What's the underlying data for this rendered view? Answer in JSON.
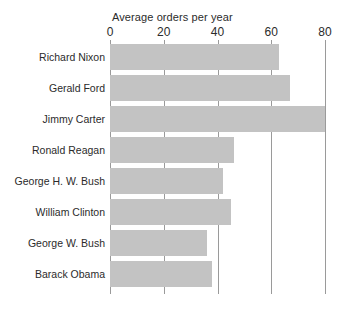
{
  "chart_data": {
    "type": "bar",
    "orientation": "horizontal",
    "title": "Average orders per year",
    "xlabel": "",
    "ylabel": "",
    "categories": [
      "Richard Nixon",
      "Gerald Ford",
      "Jimmy Carter",
      "Ronald Reagan",
      "George H. W. Bush",
      "William Clinton",
      "George W. Bush",
      "Barack Obama"
    ],
    "values": [
      63,
      67,
      80,
      46,
      42,
      45,
      36,
      38
    ],
    "xlim": [
      0,
      80
    ],
    "xticks": [
      0,
      20,
      40,
      60,
      80
    ],
    "xtick_labels": [
      "0",
      "20",
      "40",
      "60",
      "80"
    ],
    "grid": true,
    "legend": false,
    "bar_color": "#c3c3c3",
    "grid_color": "#9a9a9a",
    "text_color": "#2b2b2b",
    "background_color": "#ffffff"
  }
}
